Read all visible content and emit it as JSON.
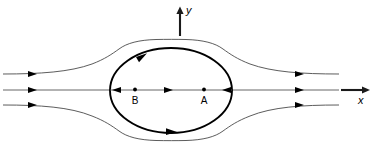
{
  "figure": {
    "background_color": "#ffffff",
    "width": 375,
    "height": 148
  },
  "axes": {
    "y_axis": {
      "label": "y",
      "name": "y-axis",
      "direction": "up",
      "x": 180,
      "y_top": 8,
      "y_bottom": 36,
      "label_x": 186,
      "label_y": 13
    },
    "x_axis": {
      "label": "x",
      "name": "x-axis",
      "direction": "right",
      "y": 90,
      "x_left": 341,
      "x_right": 370,
      "label_x": 361,
      "label_y": 101
    }
  },
  "body": {
    "name": "oval-body",
    "shape": "ellipse",
    "center_x": 171,
    "center_y": 90.5,
    "radius_x": 61,
    "radius_y": 42.5,
    "stroke_color": "#000000",
    "circulation_direction": "clockwise"
  },
  "points": [
    {
      "id": "B",
      "label": "B",
      "name": "point-b",
      "x": 135,
      "y": 90,
      "label_x": 135,
      "label_y": 103,
      "description": "interior source point"
    },
    {
      "id": "A",
      "label": "A",
      "name": "point-a",
      "x": 204,
      "y": 90,
      "label_x": 204,
      "label_y": 103,
      "description": "interior sink point"
    }
  ],
  "streamlines": {
    "color": "#4a4a4a",
    "left_entry_y": [
      74,
      90,
      105
    ],
    "right_exit_y": [
      74,
      90,
      105
    ],
    "count": 3,
    "outer_envelope": "dividing streamline hugging the oval body"
  },
  "flow_arrows": {
    "left_inlet_count": 3,
    "right_outlet_count": 3,
    "axis_interior_count": 3,
    "body_outline_count": 2,
    "color": "#000000"
  },
  "legend": {
    "visible": false
  }
}
